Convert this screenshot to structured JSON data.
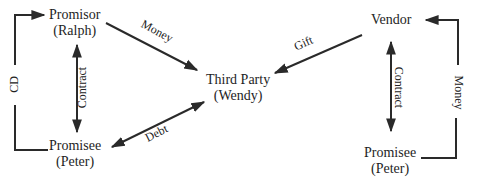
{
  "diagrams": [
    {
      "name": "third-party-beneficiary",
      "nodes": {
        "promisor": {
          "line1": "Promisor",
          "line2": "(Ralph)"
        },
        "promisee": {
          "line1": "Promisee",
          "line2": "(Peter)"
        },
        "third_party": {
          "line1": "Third Party",
          "line2": "(Wendy)"
        }
      },
      "edges": {
        "cd": "CD",
        "contract": "Contract",
        "money": "Money",
        "debt": "Debt"
      }
    },
    {
      "name": "vendor-transaction",
      "nodes": {
        "vendor": {
          "line1": "Vendor"
        },
        "promisee": {
          "line1": "Promisee",
          "line2": "(Peter)"
        }
      },
      "edges": {
        "gift": "Gift",
        "contract": "Contract",
        "money": "Money"
      }
    }
  ],
  "colors": {
    "line": "#2a2a2a",
    "text": "#1e1e1e",
    "background": "#ffffff"
  }
}
